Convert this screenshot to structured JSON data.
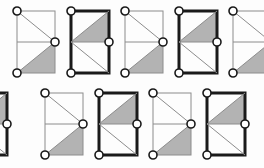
{
  "figure": {
    "background_color": "#fdfdfd",
    "shade_color": "#b3b3b3",
    "thin_stroke_color": "#8c8c8c",
    "bold_stroke_color": "#1a1a1a",
    "node_fill_color": "#ffffff",
    "node_stroke_color": "#1a1a1a",
    "thin_stroke_width": "1",
    "bold_stroke_width": "3",
    "node_radius": "4",
    "rows": 2,
    "columns": 5
  },
  "chart_data": {
    "type": "diagram",
    "cells": [
      {
        "index": 1,
        "row": "top",
        "column": 1,
        "style": "thin",
        "shaded_region": "lower-right-triangle",
        "diagonal": "top-left-to-mid-right-and-mid-right-to-bottom-left",
        "nodes": [
          "top-left",
          "mid-right",
          "bottom-left"
        ],
        "clipped": "none",
        "x": 14,
        "y": 8
      },
      {
        "index": 2,
        "row": "top",
        "column": 2,
        "style": "bold",
        "shaded_region": "upper-right-triangle",
        "diagonal": "mid-left-to-top-right-and-mid-left-to-bottom-right",
        "nodes": [
          "top-left",
          "mid-right",
          "bottom-left"
        ],
        "clipped": "none",
        "x": 68,
        "y": 8
      },
      {
        "index": 3,
        "row": "top",
        "column": 3,
        "style": "thin",
        "shaded_region": "lower-right-triangle",
        "diagonal": "top-left-to-mid-right-and-mid-right-to-bottom-left",
        "nodes": [
          "top-left",
          "mid-right",
          "bottom-left"
        ],
        "clipped": "none",
        "x": 122,
        "y": 8
      },
      {
        "index": 4,
        "row": "top",
        "column": 4,
        "style": "bold",
        "shaded_region": "upper-right-triangle",
        "diagonal": "mid-left-to-top-right-and-mid-left-to-bottom-right",
        "nodes": [
          "top-left",
          "mid-right",
          "bottom-left"
        ],
        "clipped": "none",
        "x": 176,
        "y": 8
      },
      {
        "index": 5,
        "row": "top",
        "column": 5,
        "style": "thin",
        "shaded_region": "lower-right-triangle",
        "diagonal": "top-left-to-mid-right-and-mid-right-to-bottom-left",
        "nodes": [
          "top-left",
          "bottom-left"
        ],
        "clipped": "right-edge",
        "x": 230,
        "y": 8
      },
      {
        "index": 6,
        "row": "bottom",
        "column": 1,
        "style": "bold",
        "shaded_region": "upper-right-triangle",
        "diagonal": "mid-left-to-top-right-and-mid-left-to-bottom-right",
        "nodes": [
          "mid-right"
        ],
        "clipped": "left-edge",
        "x": -34,
        "y": 90
      },
      {
        "index": 7,
        "row": "bottom",
        "column": 2,
        "style": "thin",
        "shaded_region": "lower-right-triangle",
        "diagonal": "top-left-to-mid-right-and-mid-right-to-bottom-left",
        "nodes": [
          "top-left",
          "mid-right",
          "bottom-left"
        ],
        "clipped": "none",
        "x": 42,
        "y": 90
      },
      {
        "index": 8,
        "row": "bottom",
        "column": 3,
        "style": "bold",
        "shaded_region": "upper-right-triangle",
        "diagonal": "mid-left-to-top-right-and-mid-left-to-bottom-right",
        "nodes": [
          "top-left",
          "mid-right",
          "bottom-left"
        ],
        "clipped": "none",
        "x": 96,
        "y": 90
      },
      {
        "index": 9,
        "row": "bottom",
        "column": 4,
        "style": "thin",
        "shaded_region": "lower-right-triangle",
        "diagonal": "top-left-to-mid-right-and-mid-right-to-bottom-left",
        "nodes": [
          "top-left",
          "mid-right",
          "bottom-left"
        ],
        "clipped": "none",
        "x": 150,
        "y": 90
      },
      {
        "index": 10,
        "row": "bottom",
        "column": 5,
        "style": "bold",
        "shaded_region": "upper-right-triangle",
        "diagonal": "mid-left-to-top-right-and-mid-left-to-bottom-right",
        "nodes": [
          "top-left",
          "mid-right",
          "bottom-left"
        ],
        "clipped": "none",
        "x": 204,
        "y": 90
      }
    ]
  }
}
